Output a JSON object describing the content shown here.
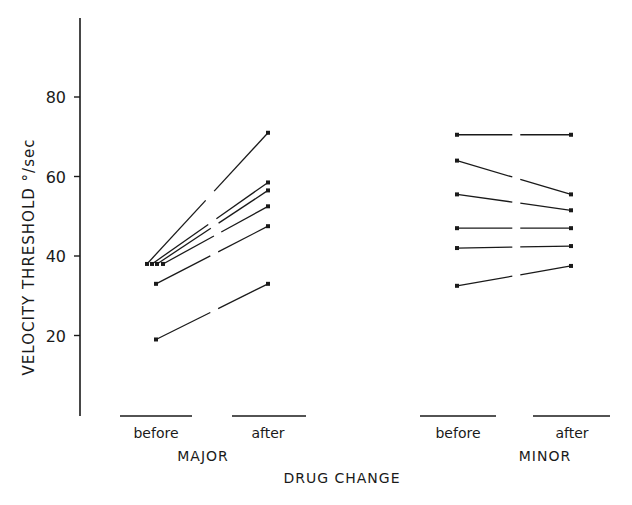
{
  "chart_data": {
    "type": "line",
    "title": "",
    "xlabel": "DRUG CHANGE",
    "ylabel": "VELOCITY THRESHOLD °/sec",
    "ylim": [
      0,
      100
    ],
    "yticks": [
      20,
      40,
      60,
      80
    ],
    "grid": false,
    "legend": null,
    "groups": [
      {
        "name": "MAJOR",
        "categories": [
          "before",
          "after"
        ],
        "series": [
          {
            "name": "subject 1",
            "values": [
              38,
              71
            ]
          },
          {
            "name": "subject 2",
            "values": [
              38,
              58.5
            ]
          },
          {
            "name": "subject 3",
            "values": [
              38,
              56.5
            ]
          },
          {
            "name": "subject 4",
            "values": [
              38,
              52.5
            ]
          },
          {
            "name": "subject 5",
            "values": [
              33,
              47.5
            ]
          },
          {
            "name": "subject 6",
            "values": [
              19,
              33
            ]
          }
        ]
      },
      {
        "name": "MINOR",
        "categories": [
          "before",
          "after"
        ],
        "series": [
          {
            "name": "subject 1",
            "values": [
              70.5,
              70.5
            ]
          },
          {
            "name": "subject 2",
            "values": [
              64,
              55.5
            ]
          },
          {
            "name": "subject 3",
            "values": [
              55.5,
              51.5
            ]
          },
          {
            "name": "subject 4",
            "values": [
              47,
              47
            ]
          },
          {
            "name": "subject 5",
            "values": [
              42,
              42.5
            ]
          },
          {
            "name": "subject 6",
            "values": [
              32.5,
              37.5
            ]
          }
        ]
      }
    ]
  },
  "labels": {
    "y_axis": "VELOCITY THRESHOLD  °/sec",
    "x_axis": "DRUG CHANGE",
    "major": "MAJOR",
    "minor": "MINOR",
    "before": "before",
    "after": "after"
  },
  "colors": {
    "ink": "#1a1a1a",
    "background": "#ffffff"
  }
}
